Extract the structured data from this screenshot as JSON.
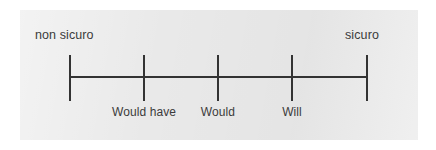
{
  "figure": {
    "type": "rating-scale",
    "background_color": "#ffffff",
    "panel_color": "#e9e9e9",
    "line_color": "#333333",
    "text_color": "#3b3b3b"
  },
  "scale": {
    "anchor_left": "non sicuro",
    "anchor_right": "sicuro",
    "tick_count": 5,
    "ticks": [
      {
        "x": 70,
        "label": ""
      },
      {
        "x": 144,
        "label": "Would have"
      },
      {
        "x": 218,
        "label": "Would"
      },
      {
        "x": 292,
        "label": "Will"
      },
      {
        "x": 367,
        "label": ""
      }
    ],
    "line": {
      "x_start": 70,
      "x_end": 367,
      "y": 76
    }
  },
  "chart_data": {
    "type": "line",
    "title": "",
    "xlabel": "",
    "ylabel": "",
    "categories": [
      "",
      "Would have",
      "Would",
      "Will",
      ""
    ],
    "x": [
      70,
      144,
      218,
      292,
      367
    ],
    "values": [
      0,
      0,
      0,
      0,
      0
    ],
    "annotations": [
      "non sicuro",
      "sicuro"
    ],
    "axis_range": [
      70,
      367
    ],
    "grid": false,
    "legend": "none"
  }
}
